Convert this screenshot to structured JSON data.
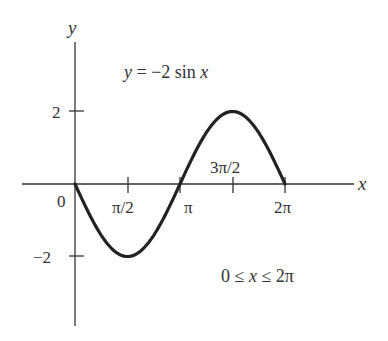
{
  "chart_data": {
    "type": "line",
    "title": "y = −2 sin x",
    "annotation": "0 ≤ x ≤ 2π",
    "xlabel": "x",
    "ylabel": "y",
    "function": "y = -2 sin x",
    "domain": [
      0,
      6.283185
    ],
    "x_ticks": [
      "0",
      "π/2",
      "π",
      "3π/2",
      "2π"
    ],
    "x_tick_values": [
      0,
      1.5708,
      3.1416,
      4.7124,
      6.2832
    ],
    "y_ticks": [
      "2",
      "−2"
    ],
    "y_tick_values": [
      2,
      -2
    ],
    "points": [
      {
        "x": "0",
        "y": 0
      },
      {
        "x": "π/2",
        "y": -2
      },
      {
        "x": "π",
        "y": 0
      },
      {
        "x": "3π/2",
        "y": 2
      },
      {
        "x": "2π",
        "y": 0
      }
    ],
    "ylim": [
      -3.2,
      3.2
    ],
    "grid": false,
    "line_color": "#222222"
  },
  "labels": {
    "y_axis": "y",
    "x_axis": "x",
    "origin": "0",
    "tick_pi_half": "π/2",
    "tick_pi": "π",
    "tick_three_pi_half": "3π/2",
    "tick_two_pi": "2π",
    "tick_y_pos2": "2",
    "tick_y_neg2": "−2",
    "equation_lhs": "y",
    "equation_rhs": " = −2 sin ",
    "equation_var": "x",
    "domain_text_a": "0 ≤ ",
    "domain_var": "x",
    "domain_text_b": " ≤ 2π"
  }
}
